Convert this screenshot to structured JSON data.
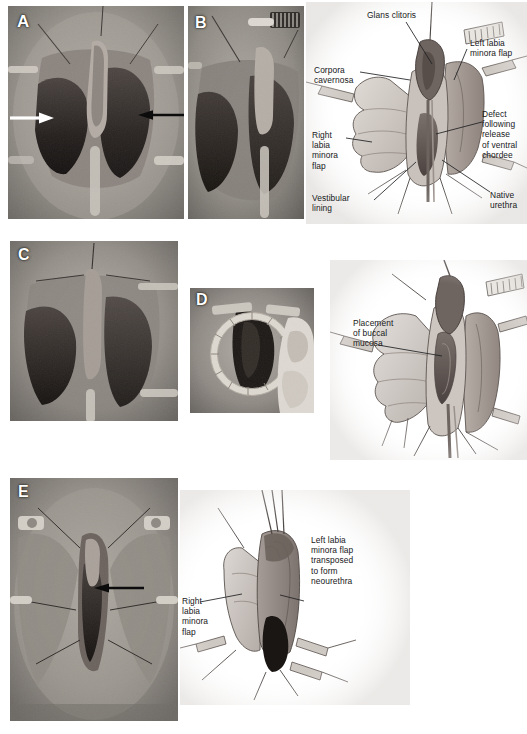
{
  "figure": {
    "background_color": "#ffffff",
    "width": 527,
    "height": 734
  },
  "panels": [
    {
      "id": "A",
      "letter": "A",
      "type": "photograph",
      "description": "Intraoperative photograph of perineum with retracted flaps, white arrow at left and black arrow at right",
      "markers": [
        "white-arrow",
        "black-arrow"
      ]
    },
    {
      "id": "B",
      "letter": "B",
      "type": "photograph",
      "description": "Intraoperative photograph, closer view with comb-like retractor at upper right",
      "markers": []
    },
    {
      "id": "C",
      "letter": "C",
      "type": "photograph",
      "description": "Intraoperative photograph after release of ventral chordee",
      "markers": []
    },
    {
      "id": "D",
      "letter": "D",
      "type": "photograph",
      "description": "Intraoperative photograph with circular ring retractor in place, surgeon's gloved hand at right",
      "markers": []
    },
    {
      "id": "E",
      "letter": "E",
      "type": "photograph",
      "description": "Intraoperative photograph of completed repair with black arrow indicating neourethral meatus",
      "markers": [
        "black-arrow"
      ]
    }
  ],
  "diagrams": [
    {
      "id": "diagram-top",
      "name": "anatomy-after-chordee-release",
      "labels": [
        {
          "id": "glans-clitoris",
          "text": "Glans clitoris"
        },
        {
          "id": "left-labia-minora-flap",
          "text": "Left labia\nminora flap"
        },
        {
          "id": "corpora-cavernosa",
          "text": "Corpora\ncavernosa"
        },
        {
          "id": "defect-following-release",
          "text": "Defect\nfollowing\nrelease\nof ventral\nchordee"
        },
        {
          "id": "right-labia-minora-flap",
          "text": "Right\nlabia\nminora\nflap"
        },
        {
          "id": "vestibular-lining",
          "text": "Vestibular\nlining"
        },
        {
          "id": "native-urethra",
          "text": "Native\nurethra"
        }
      ]
    },
    {
      "id": "diagram-middle",
      "name": "buccal-mucosa-placement",
      "labels": [
        {
          "id": "placement-of-buccal-mucosa",
          "text": "Placement\nof buccal\nmucosa"
        }
      ]
    },
    {
      "id": "diagram-bottom",
      "name": "neourethra-formation",
      "labels": [
        {
          "id": "left-flap-transposed",
          "text": "Left labia\nminora flap\ntransposed\nto form\nneourethra"
        },
        {
          "id": "right-labia-minora-flap-bottom",
          "text": "Right\nlabia\nminora\nflap"
        }
      ]
    }
  ],
  "caption": {
    "text": "",
    "visible": false
  },
  "colors": {
    "page_background": "#ffffff",
    "label_text": "#17181a",
    "leader_line": "#2b2c2e",
    "diagram_fill_light": "#cfcac6",
    "diagram_fill_mid": "#a9a19c",
    "diagram_fill_dark": "#6e6561",
    "diagram_fill_darkest": "#231f1e",
    "photo_mid": "#8d8d8d"
  }
}
